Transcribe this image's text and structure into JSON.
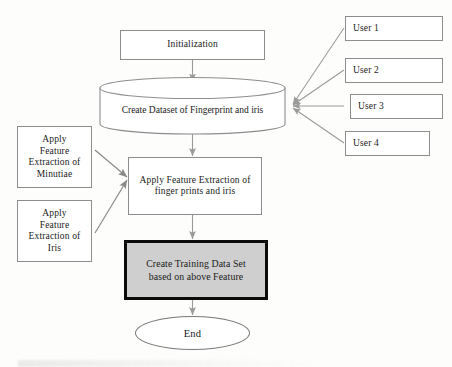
{
  "diagram": {
    "type": "flowchart",
    "colors": {
      "node_border": "#8d8d8d",
      "node_fill": "#ffffff",
      "shaded_fill": "#cfcfcf",
      "shaded_border": "#0b0b0b",
      "connector": "#8a8a8a",
      "text": "#1a1a1a",
      "page_background": "#fdfdfc"
    },
    "nodes": {
      "initialization": {
        "label": "Initialization",
        "shape": "rectangle"
      },
      "dataset": {
        "label": "Create Dataset of Fingerprint and iris",
        "shape": "cylinder"
      },
      "users": [
        {
          "label": "User 1",
          "shape": "rectangle"
        },
        {
          "label": "User 2",
          "shape": "rectangle"
        },
        {
          "label": "User 3",
          "shape": "rectangle"
        },
        {
          "label": "User 4",
          "shape": "rectangle"
        }
      ],
      "minutiae": {
        "shape": "rectangle",
        "lines": [
          "Apply",
          "Feature",
          "Extraction of",
          "Minutiae"
        ]
      },
      "iris": {
        "shape": "rectangle",
        "lines": [
          "Apply",
          "Feature",
          "Extraction of",
          "Iris"
        ]
      },
      "feature_extraction": {
        "shape": "rectangle",
        "lines": [
          "Apply Feature Extraction of",
          "finger prints and iris"
        ]
      },
      "training_set": {
        "shape": "rectangle-shaded",
        "lines": [
          "Create Training Data Set",
          "based on above Feature"
        ]
      },
      "end": {
        "label": "End",
        "shape": "ellipse"
      }
    },
    "edges": [
      {
        "from": "initialization",
        "to": "dataset",
        "direction": "down"
      },
      {
        "from": "user-1",
        "to": "dataset",
        "direction": "left"
      },
      {
        "from": "user-2",
        "to": "dataset",
        "direction": "left"
      },
      {
        "from": "user-3",
        "to": "dataset",
        "direction": "left"
      },
      {
        "from": "user-4",
        "to": "dataset",
        "direction": "left"
      },
      {
        "from": "dataset",
        "to": "feature_extraction",
        "direction": "down"
      },
      {
        "from": "minutiae",
        "to": "feature_extraction",
        "direction": "right"
      },
      {
        "from": "iris",
        "to": "feature_extraction",
        "direction": "right"
      },
      {
        "from": "feature_extraction",
        "to": "training_set",
        "direction": "down"
      },
      {
        "from": "training_set",
        "to": "end",
        "direction": "down"
      }
    ]
  }
}
